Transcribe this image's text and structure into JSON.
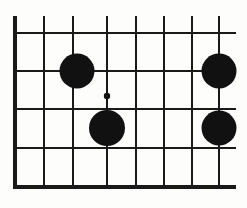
{
  "figure": {
    "kind": "go-board-diagram",
    "board": {
      "orientation": "bottom-left-corner",
      "edges_shown": [
        "left",
        "bottom"
      ],
      "line_color": "#1a1a1a",
      "background_color": "#fdfdfc",
      "vertical_line_count": 8,
      "horizontal_line_count": 5,
      "vertical_line_x": [
        15,
        44,
        73,
        107,
        136,
        164,
        192,
        219
      ],
      "horizontal_line_y": [
        33,
        71,
        109,
        148,
        187
      ],
      "left_edge_x": 15,
      "bottom_edge_y": 187,
      "grid_right_extent": 236,
      "grid_top_extent": 16,
      "edge_stroke_width": 4.2,
      "inner_stroke_width": 1.9
    },
    "stones": [
      {
        "id": "stone-1",
        "color": "black",
        "cx": 77,
        "cy": 71,
        "r": 17.5,
        "label": "black-stone-upper-left"
      },
      {
        "id": "stone-2",
        "color": "black",
        "cx": 219,
        "cy": 71,
        "r": 17.5,
        "label": "black-stone-upper-right"
      },
      {
        "id": "stone-3",
        "color": "black",
        "cx": 107,
        "cy": 128,
        "r": 18.0,
        "label": "black-stone-lower-left"
      },
      {
        "id": "stone-4",
        "color": "black",
        "cx": 219,
        "cy": 128,
        "r": 17.5,
        "label": "black-stone-lower-right"
      }
    ],
    "star_points": [
      {
        "id": "star-1",
        "cx": 107,
        "cy": 96,
        "r": 3.2,
        "label": "star-point-hoshi"
      }
    ],
    "colors": {
      "stone_black": "#111111",
      "grid": "#1a1a1a",
      "paper": "#fdfdfc"
    }
  }
}
